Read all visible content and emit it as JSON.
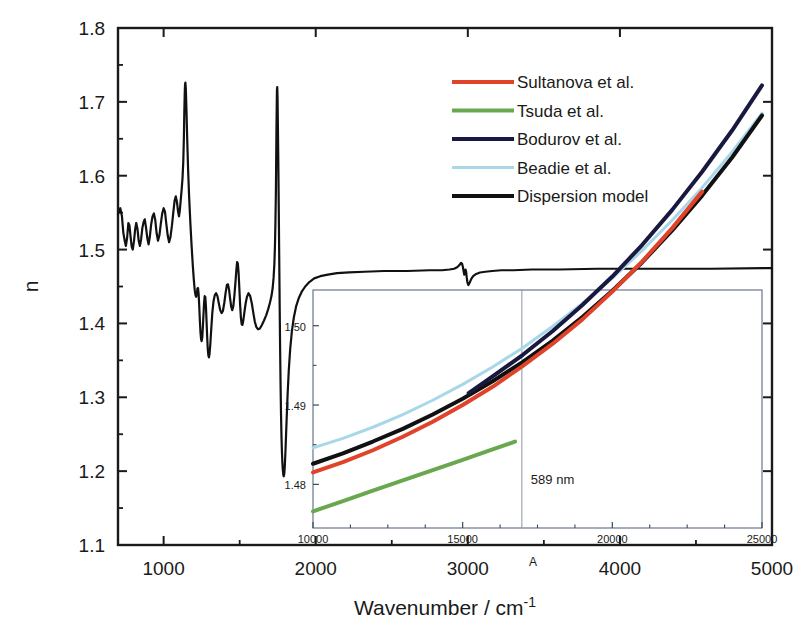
{
  "chart_data": {
    "type": "line",
    "title": "",
    "xlabel": "Wavenumber / cm",
    "xlabel_sup": "-1",
    "ylabel": "n",
    "xlim": [
      700,
      5000
    ],
    "ylim": [
      1.1,
      1.8
    ],
    "xticks": [
      1000,
      2000,
      3000,
      4000,
      5000
    ],
    "xtick_labels": [
      "1000",
      "2000",
      "3000",
      "4000",
      "5000"
    ],
    "yticks": [
      1.1,
      1.2,
      1.3,
      1.4,
      1.5,
      1.6,
      1.7,
      1.8
    ],
    "ytick_labels": [
      "1.1",
      "1.2",
      "1.3",
      "1.4",
      "1.5",
      "1.6",
      "1.7",
      "1.8"
    ],
    "minor_xticks": [
      1500,
      2500,
      3500,
      4500
    ],
    "minor_yticks": [
      1.15,
      1.25,
      1.35,
      1.45,
      1.55,
      1.65,
      1.75
    ],
    "grid": false,
    "legend_position": "top-right",
    "legend": [
      {
        "label": "Sultanova et al.",
        "color": "#e0432a"
      },
      {
        "label": "Tsuda et al.",
        "color": "#6aa84f"
      },
      {
        "label": "Bodurov et al.",
        "color": "#19193f"
      },
      {
        "label": "Beadie et al.",
        "color": "#a9d7ea"
      },
      {
        "label": "Dispersion model",
        "color": "#111111"
      }
    ],
    "axis_annotation": "A",
    "main_series": {
      "name": "Dispersion model",
      "color": "#111111",
      "description": "Refractive index n vs wavenumber showing anomalous dispersion resonances",
      "points": [
        [
          700,
          1.548
        ],
        [
          715,
          1.556
        ],
        [
          726,
          1.545
        ],
        [
          735,
          1.523
        ],
        [
          744,
          1.512
        ],
        [
          752,
          1.505
        ],
        [
          760,
          1.516
        ],
        [
          768,
          1.536
        ],
        [
          775,
          1.533
        ],
        [
          783,
          1.517
        ],
        [
          790,
          1.504
        ],
        [
          797,
          1.5
        ],
        [
          805,
          1.511
        ],
        [
          813,
          1.528
        ],
        [
          820,
          1.536
        ],
        [
          828,
          1.528
        ],
        [
          836,
          1.512
        ],
        [
          844,
          1.505
        ],
        [
          852,
          1.514
        ],
        [
          860,
          1.529
        ],
        [
          868,
          1.537
        ],
        [
          876,
          1.541
        ],
        [
          884,
          1.53
        ],
        [
          893,
          1.515
        ],
        [
          901,
          1.507
        ],
        [
          909,
          1.517
        ],
        [
          918,
          1.534
        ],
        [
          927,
          1.545
        ],
        [
          936,
          1.549
        ],
        [
          945,
          1.54
        ],
        [
          954,
          1.522
        ],
        [
          963,
          1.512
        ],
        [
          972,
          1.519
        ],
        [
          981,
          1.534
        ],
        [
          990,
          1.548
        ],
        [
          1000,
          1.556
        ],
        [
          1009,
          1.551
        ],
        [
          1018,
          1.534
        ],
        [
          1027,
          1.519
        ],
        [
          1036,
          1.51
        ],
        [
          1045,
          1.517
        ],
        [
          1055,
          1.533
        ],
        [
          1064,
          1.551
        ],
        [
          1072,
          1.566
        ],
        [
          1080,
          1.572
        ],
        [
          1088,
          1.564
        ],
        [
          1095,
          1.551
        ],
        [
          1101,
          1.545
        ],
        [
          1106,
          1.552
        ],
        [
          1112,
          1.566
        ],
        [
          1118,
          1.58
        ],
        [
          1124,
          1.596
        ],
        [
          1129,
          1.618
        ],
        [
          1133,
          1.65
        ],
        [
          1136,
          1.686
        ],
        [
          1139,
          1.713
        ],
        [
          1141,
          1.724
        ],
        [
          1143,
          1.726
        ],
        [
          1146,
          1.718
        ],
        [
          1150,
          1.69
        ],
        [
          1155,
          1.65
        ],
        [
          1161,
          1.608
        ],
        [
          1168,
          1.57
        ],
        [
          1176,
          1.535
        ],
        [
          1184,
          1.505
        ],
        [
          1192,
          1.478
        ],
        [
          1199,
          1.458
        ],
        [
          1205,
          1.444
        ],
        [
          1210,
          1.438
        ],
        [
          1214,
          1.436
        ],
        [
          1218,
          1.44
        ],
        [
          1222,
          1.447
        ],
        [
          1226,
          1.448
        ],
        [
          1230,
          1.44
        ],
        [
          1234,
          1.424
        ],
        [
          1238,
          1.405
        ],
        [
          1242,
          1.389
        ],
        [
          1246,
          1.379
        ],
        [
          1250,
          1.376
        ],
        [
          1254,
          1.381
        ],
        [
          1258,
          1.395
        ],
        [
          1262,
          1.412
        ],
        [
          1266,
          1.428
        ],
        [
          1270,
          1.437
        ],
        [
          1274,
          1.436
        ],
        [
          1278,
          1.424
        ],
        [
          1282,
          1.404
        ],
        [
          1286,
          1.383
        ],
        [
          1290,
          1.366
        ],
        [
          1294,
          1.357
        ],
        [
          1298,
          1.354
        ],
        [
          1302,
          1.359
        ],
        [
          1307,
          1.372
        ],
        [
          1313,
          1.392
        ],
        [
          1320,
          1.414
        ],
        [
          1328,
          1.43
        ],
        [
          1336,
          1.438
        ],
        [
          1345,
          1.441
        ],
        [
          1354,
          1.437
        ],
        [
          1363,
          1.427
        ],
        [
          1372,
          1.418
        ],
        [
          1381,
          1.414
        ],
        [
          1390,
          1.417
        ],
        [
          1399,
          1.428
        ],
        [
          1408,
          1.442
        ],
        [
          1416,
          1.452
        ],
        [
          1423,
          1.453
        ],
        [
          1430,
          1.446
        ],
        [
          1437,
          1.434
        ],
        [
          1444,
          1.423
        ],
        [
          1451,
          1.418
        ],
        [
          1458,
          1.423
        ],
        [
          1465,
          1.437
        ],
        [
          1472,
          1.455
        ],
        [
          1478,
          1.472
        ],
        [
          1483,
          1.483
        ],
        [
          1488,
          1.481
        ],
        [
          1493,
          1.468
        ],
        [
          1498,
          1.447
        ],
        [
          1503,
          1.425
        ],
        [
          1508,
          1.408
        ],
        [
          1513,
          1.399
        ],
        [
          1518,
          1.398
        ],
        [
          1524,
          1.404
        ],
        [
          1531,
          1.415
        ],
        [
          1539,
          1.427
        ],
        [
          1548,
          1.436
        ],
        [
          1558,
          1.441
        ],
        [
          1569,
          1.437
        ],
        [
          1580,
          1.427
        ],
        [
          1590,
          1.414
        ],
        [
          1600,
          1.402
        ],
        [
          1610,
          1.395
        ],
        [
          1621,
          1.392
        ],
        [
          1633,
          1.393
        ],
        [
          1646,
          1.398
        ],
        [
          1660,
          1.404
        ],
        [
          1674,
          1.411
        ],
        [
          1687,
          1.419
        ],
        [
          1699,
          1.428
        ],
        [
          1709,
          1.437
        ],
        [
          1717,
          1.448
        ],
        [
          1723,
          1.462
        ],
        [
          1728,
          1.48
        ],
        [
          1732,
          1.505
        ],
        [
          1735,
          1.536
        ],
        [
          1738,
          1.576
        ],
        [
          1740,
          1.62
        ],
        [
          1742,
          1.665
        ],
        [
          1744,
          1.7
        ],
        [
          1745,
          1.716
        ],
        [
          1747,
          1.72
        ],
        [
          1749,
          1.706
        ],
        [
          1751,
          1.672
        ],
        [
          1754,
          1.62
        ],
        [
          1757,
          1.556
        ],
        [
          1760,
          1.49
        ],
        [
          1763,
          1.424
        ],
        [
          1766,
          1.365
        ],
        [
          1769,
          1.315
        ],
        [
          1772,
          1.276
        ],
        [
          1775,
          1.246
        ],
        [
          1778,
          1.225
        ],
        [
          1781,
          1.211
        ],
        [
          1784,
          1.201
        ],
        [
          1787,
          1.195
        ],
        [
          1790,
          1.193
        ],
        [
          1793,
          1.196
        ],
        [
          1797,
          1.208
        ],
        [
          1802,
          1.232
        ],
        [
          1808,
          1.266
        ],
        [
          1815,
          1.303
        ],
        [
          1823,
          1.337
        ],
        [
          1832,
          1.365
        ],
        [
          1843,
          1.389
        ],
        [
          1856,
          1.408
        ],
        [
          1871,
          1.423
        ],
        [
          1888,
          1.434
        ],
        [
          1908,
          1.443
        ],
        [
          1931,
          1.45
        ],
        [
          1958,
          1.456
        ],
        [
          1990,
          1.461
        ],
        [
          2030,
          1.464
        ],
        [
          2080,
          1.466
        ],
        [
          2140,
          1.468
        ],
        [
          2220,
          1.469
        ],
        [
          2320,
          1.47
        ],
        [
          2450,
          1.471
        ],
        [
          2600,
          1.471
        ],
        [
          2750,
          1.472
        ],
        [
          2830,
          1.472
        ],
        [
          2880,
          1.473
        ],
        [
          2910,
          1.474
        ],
        [
          2930,
          1.476
        ],
        [
          2945,
          1.479
        ],
        [
          2955,
          1.482
        ],
        [
          2962,
          1.481
        ],
        [
          2968,
          1.476
        ],
        [
          2973,
          1.47
        ],
        [
          2977,
          1.466
        ],
        [
          2981,
          1.469
        ],
        [
          2985,
          1.473
        ],
        [
          2989,
          1.47
        ],
        [
          2993,
          1.462
        ],
        [
          2998,
          1.455
        ],
        [
          3004,
          1.452
        ],
        [
          3012,
          1.455
        ],
        [
          3022,
          1.46
        ],
        [
          3035,
          1.464
        ],
        [
          3055,
          1.467
        ],
        [
          3080,
          1.469
        ],
        [
          3115,
          1.47
        ],
        [
          3160,
          1.471
        ],
        [
          3220,
          1.472
        ],
        [
          3300,
          1.472
        ],
        [
          3420,
          1.473
        ],
        [
          3600,
          1.473
        ],
        [
          3850,
          1.474
        ],
        [
          4200,
          1.474
        ],
        [
          4600,
          1.474
        ],
        [
          5000,
          1.475
        ]
      ]
    },
    "inset": {
      "xlim": [
        10000,
        25000
      ],
      "ylim": [
        1.4745,
        1.5045
      ],
      "xticks": [
        10000,
        15000,
        20000,
        25000
      ],
      "xtick_labels": [
        "10000",
        "15000",
        "20000",
        "25000"
      ],
      "yticks": [
        1.48,
        1.49,
        1.5
      ],
      "ytick_labels": [
        "1.48",
        "1.49",
        "1.50"
      ],
      "minor_xticks": [
        11250,
        12500,
        13750,
        16250,
        17500,
        18750,
        21250,
        22500,
        23750
      ],
      "minor_yticks": [
        1.485,
        1.495
      ],
      "marker_line": {
        "label": "589 nm",
        "x": 16978
      },
      "series": [
        {
          "name": "Beadie et al.",
          "color": "#a9d7ea",
          "width": 3,
          "points": [
            [
              10000,
              1.4846
            ],
            [
              11000,
              1.4858
            ],
            [
              12000,
              1.4872
            ],
            [
              13000,
              1.4888
            ],
            [
              14000,
              1.4906
            ],
            [
              15000,
              1.4926
            ],
            [
              16000,
              1.4948
            ],
            [
              17000,
              1.4972
            ],
            [
              18000,
              1.4999
            ],
            [
              19000,
              1.5028
            ],
            [
              20000,
              1.506
            ],
            [
              21000,
              1.5095
            ],
            [
              22000,
              1.5133
            ],
            [
              23000,
              1.5174
            ],
            [
              24000,
              1.5219
            ],
            [
              25000,
              1.5268
            ]
          ]
        },
        {
          "name": "Dispersion model",
          "color": "#111111",
          "width": 4,
          "points": [
            [
              10000,
              1.4826
            ],
            [
              11000,
              1.4839
            ],
            [
              12000,
              1.4854
            ],
            [
              13000,
              1.487
            ],
            [
              14000,
              1.4888
            ],
            [
              15000,
              1.4908
            ],
            [
              16000,
              1.493
            ],
            [
              17000,
              1.4954
            ],
            [
              18000,
              1.4981
            ],
            [
              19000,
              1.5011
            ],
            [
              20000,
              1.5044
            ],
            [
              21000,
              1.508
            ],
            [
              22000,
              1.512
            ],
            [
              23000,
              1.5164
            ],
            [
              24000,
              1.5212
            ],
            [
              25000,
              1.5265
            ]
          ]
        },
        {
          "name": "Sultanova et al.",
          "color": "#e0432a",
          "width": 4,
          "points": [
            [
              10000,
              1.4815
            ],
            [
              11000,
              1.4828
            ],
            [
              12000,
              1.4843
            ],
            [
              13000,
              1.486
            ],
            [
              14000,
              1.4879
            ],
            [
              15000,
              1.49
            ],
            [
              16000,
              1.4923
            ],
            [
              17000,
              1.4949
            ],
            [
              18000,
              1.4977
            ],
            [
              19000,
              1.5008
            ],
            [
              20000,
              1.5043
            ],
            [
              21000,
              1.5081
            ],
            [
              22000,
              1.5123
            ],
            [
              23000,
              1.5169
            ]
          ]
        },
        {
          "name": "Bodurov et al.",
          "color": "#19193f",
          "width": 4,
          "points": [
            [
              15200,
              1.4915
            ],
            [
              16000,
              1.4936
            ],
            [
              17000,
              1.4963
            ],
            [
              18000,
              1.4993
            ],
            [
              19000,
              1.5026
            ],
            [
              20000,
              1.5062
            ],
            [
              21000,
              1.5102
            ],
            [
              22000,
              1.5146
            ],
            [
              23000,
              1.5194
            ],
            [
              24000,
              1.5246
            ],
            [
              25000,
              1.5303
            ]
          ]
        },
        {
          "name": "Tsuda et al.",
          "color": "#6aa84f",
          "width": 4,
          "points": [
            [
              10000,
              1.4766
            ],
            [
              11000,
              1.4779
            ],
            [
              12000,
              1.4792
            ],
            [
              13000,
              1.4805
            ],
            [
              14000,
              1.4818
            ],
            [
              15000,
              1.4831
            ],
            [
              16000,
              1.4844
            ],
            [
              16750,
              1.4854
            ]
          ]
        }
      ]
    }
  }
}
